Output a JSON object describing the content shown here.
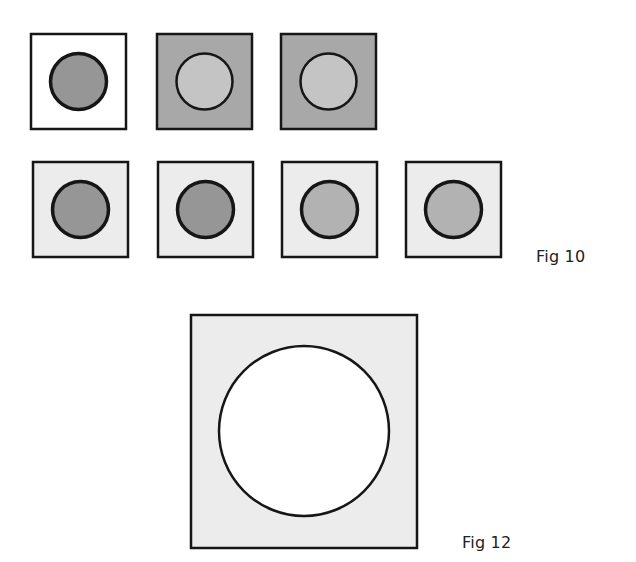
{
  "colors": {
    "stroke": "#161616",
    "white": "#ffffff",
    "light_gray": "#ececec",
    "mid_gray": "#a8a8a8",
    "dark_gray": "#969696",
    "circle_light": "#c4c4c4",
    "circle_mid": "#b2b2b2"
  },
  "figures": {
    "fig10": {
      "label": "Fig 10",
      "rows": [
        [
          {
            "square_fill": "white",
            "circle_fill": "dark_gray"
          },
          {
            "square_fill": "mid_gray",
            "circle_fill": "circle_light"
          },
          {
            "square_fill": "mid_gray",
            "circle_fill": "circle_light"
          }
        ],
        [
          {
            "square_fill": "light_gray",
            "circle_fill": "dark_gray"
          },
          {
            "square_fill": "light_gray",
            "circle_fill": "dark_gray"
          },
          {
            "square_fill": "light_gray",
            "circle_fill": "circle_mid"
          },
          {
            "square_fill": "light_gray",
            "circle_fill": "circle_mid"
          }
        ]
      ]
    },
    "fig12": {
      "label": "Fig 12",
      "square_fill": "light_gray",
      "circle_fill": "white"
    }
  }
}
